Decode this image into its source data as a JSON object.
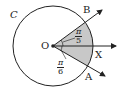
{
  "diagram": {
    "circle_label": "C",
    "center_label": "O",
    "points": {
      "B": "B",
      "X": "X",
      "A": "A"
    },
    "angle_upper": {
      "num": "π",
      "den": "5"
    },
    "angle_lower": {
      "num": "π",
      "den": "6"
    },
    "colors": {
      "stroke": "#222222",
      "sector_fill": "#c8c8c8",
      "background": "#ffffff"
    }
  }
}
